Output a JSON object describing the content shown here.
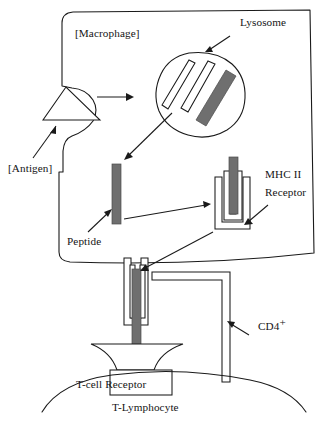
{
  "diagram": {
    "labels": {
      "macrophage": "[Macrophage]",
      "antigen": "[Antigen]",
      "lysosome": "Lysosome",
      "peptide": "Peptide",
      "mhc_line1": "MHC II",
      "mhc_line2": "Receptor",
      "cd4": "CD4",
      "cd4_superscript": "+",
      "tcell_receptor": "T-cell Receptor",
      "tlymphocyte": "T-Lymphocyte"
    },
    "colors": {
      "stroke": "#1a1a1a",
      "peptide_fill": "#6f6f6f",
      "background": "#ffffff",
      "white_fill": "#ffffff"
    },
    "structures": [
      {
        "name": "macrophage-cell-body",
        "kind": "outline",
        "description": "Large rounded rectangle occupying upper two thirds with a concave invagination on the left edge where the antigen is engulfed and a sagging lower border."
      },
      {
        "name": "antigen-particle",
        "kind": "triangle",
        "description": "Outlined triangle pointing upward nested into the macrophage membrane pocket on the left."
      },
      {
        "name": "lysosome-vesicle",
        "kind": "blob",
        "description": "Rounded organelle containing three diagonal bars: two outlined white bars and one solid gray bar representing digested peptide."
      },
      {
        "name": "free-peptide-bar",
        "kind": "bar",
        "description": "Solid gray vertical bar inside the macrophage cytoplasm, the processed peptide fragment."
      },
      {
        "name": "mhc-ii-receptor",
        "kind": "cup",
        "description": "Nested U-shaped cup inside the macrophage holding a solid gray peptide bar in its groove."
      },
      {
        "name": "mhc-ii-surface-complex",
        "kind": "cup",
        "description": "MHC II cup embedded in the lower macrophage membrane presenting the gray peptide outward toward the T cell."
      },
      {
        "name": "t-cell-receptor-complex",
        "kind": "receptor",
        "description": "Flared cup shape plus rectangular stalk on the T-lymphocyte surface that binds the peptide-MHC complex."
      },
      {
        "name": "cd4-coreceptor",
        "kind": "bent-bar",
        "description": "L-shaped outlined co-receptor: horizontal arm reaching the MHC II and a long vertical stem anchored in the T-lymphocyte membrane."
      },
      {
        "name": "t-lymphocyte-membrane",
        "kind": "arc",
        "description": "Broad downward-bulging arc forming the top surface of the T-lymphocyte at the bottom of the figure."
      }
    ],
    "arrows": [
      {
        "name": "arrow-antigen-label",
        "from": "[Antigen] label",
        "to": "antigen triangle"
      },
      {
        "name": "arrow-engulfment",
        "from": "antigen pocket",
        "to": "lysosome"
      },
      {
        "name": "arrow-lysosome-label",
        "from": "Lysosome label",
        "to": "lysosome vesicle"
      },
      {
        "name": "arrow-peptide-release",
        "from": "lysosome",
        "to": "free peptide bar"
      },
      {
        "name": "arrow-peptide-label",
        "from": "Peptide label",
        "to": "free peptide bar"
      },
      {
        "name": "arrow-peptide-loading",
        "from": "free peptide bar",
        "to": "MHC II receptor"
      },
      {
        "name": "arrow-mhc-label",
        "from": "MHC II Receptor label",
        "to": "MHC II receptor cup"
      },
      {
        "name": "arrow-mhc-trafficking",
        "from": "MHC II receptor",
        "to": "macrophage surface complex"
      },
      {
        "name": "arrow-cd4-label",
        "from": "CD4+ label",
        "to": "CD4 vertical stem"
      }
    ]
  }
}
